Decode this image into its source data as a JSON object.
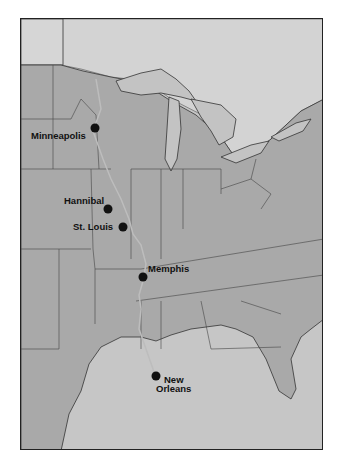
{
  "map": {
    "title": "",
    "colors": {
      "land_us": "#a8a8a8",
      "land_canada": "#cfcfcf",
      "water": "#c4c4c4",
      "river": "#bdbdbd",
      "border": "#333333",
      "city_dot": "#111111"
    },
    "cities": [
      {
        "name": "Minneapolis",
        "dot": [
          94,
          127
        ]
      },
      {
        "name": "Hannibal",
        "dot": [
          107,
          208
        ]
      },
      {
        "name": "St. Louis",
        "dot": [
          122,
          226
        ]
      },
      {
        "name": "Memphis",
        "dot": [
          142,
          276
        ]
      },
      {
        "name": "New Orleans",
        "line1": "New",
        "line2": "Orleans",
        "dot": [
          155,
          375
        ]
      }
    ]
  }
}
